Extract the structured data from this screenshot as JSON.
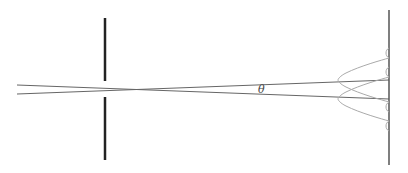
{
  "diagram": {
    "type": "diffraction-resolution",
    "labels": {
      "angle": "θ"
    },
    "colors": {
      "background": "#ffffff",
      "barrier": "#222222",
      "rays": "#555555",
      "intensity_curves": "#aaaaaa",
      "screen": "#555555"
    }
  }
}
